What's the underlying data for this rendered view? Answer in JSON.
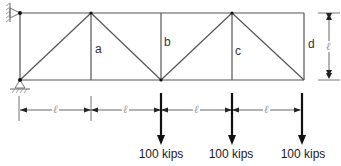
{
  "diagram": {
    "type": "truss",
    "panels": 4,
    "members_labeled": [
      {
        "label": "a",
        "x": 96,
        "y": 43
      },
      {
        "label": "b",
        "x": 165,
        "y": 36
      },
      {
        "label": "c",
        "x": 236,
        "y": 45
      },
      {
        "label": "d",
        "x": 308,
        "y": 38
      }
    ],
    "panel_length_symbol": "ℓ",
    "height_symbol": "ℓ",
    "loads": [
      {
        "label": "100 kips",
        "x": 161
      },
      {
        "label": "100 kips",
        "x": 232
      },
      {
        "label": "100 kips",
        "x": 302
      }
    ],
    "supports": [
      "pin-top-left",
      "pin-bottom-left"
    ]
  }
}
